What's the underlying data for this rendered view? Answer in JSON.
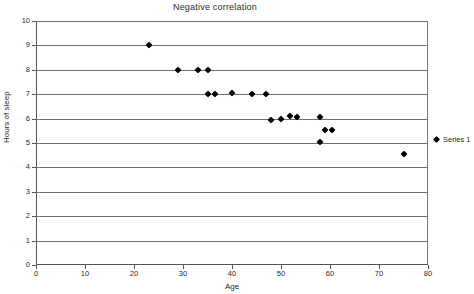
{
  "chart_data": {
    "type": "scatter",
    "title": "Negative correlation",
    "xlabel": "Age",
    "ylabel": "Hours of sleep",
    "xlim": [
      0,
      80
    ],
    "ylim": [
      0,
      10
    ],
    "xticks": [
      0,
      10,
      20,
      30,
      40,
      50,
      60,
      70,
      80
    ],
    "yticks": [
      0,
      1,
      2,
      3,
      4,
      5,
      6,
      7,
      8,
      9,
      10
    ],
    "grid": "horizontal",
    "legend_position": "right",
    "marker": "diamond",
    "marker_color": "#000000",
    "gridline_color": "#6e6e6e",
    "series": [
      {
        "name": "Series 1",
        "points": [
          {
            "x": 23,
            "y": 9
          },
          {
            "x": 29,
            "y": 8
          },
          {
            "x": 33,
            "y": 8
          },
          {
            "x": 35,
            "y": 8
          },
          {
            "x": 35,
            "y": 7
          },
          {
            "x": 36.5,
            "y": 7
          },
          {
            "x": 40,
            "y": 7.05
          },
          {
            "x": 44,
            "y": 7
          },
          {
            "x": 47,
            "y": 7
          },
          {
            "x": 48,
            "y": 5.95
          },
          {
            "x": 50,
            "y": 6
          },
          {
            "x": 51.8,
            "y": 6.1
          },
          {
            "x": 53.2,
            "y": 6.05
          },
          {
            "x": 58,
            "y": 6.05
          },
          {
            "x": 58,
            "y": 5.05
          },
          {
            "x": 59,
            "y": 5.55
          },
          {
            "x": 60.5,
            "y": 5.55
          },
          {
            "x": 75,
            "y": 4.55
          }
        ]
      }
    ]
  },
  "legend": {
    "entries": [
      {
        "label": "Series 1"
      }
    ]
  }
}
